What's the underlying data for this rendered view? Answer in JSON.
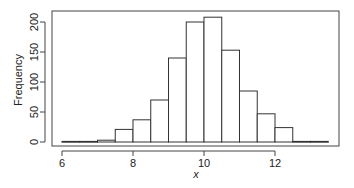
{
  "chart_data": {
    "type": "bar",
    "subtype": "histogram",
    "title": "",
    "xlabel": "x",
    "ylabel": "Frequency",
    "bin_width": 0.5,
    "bin_edges": [
      6.0,
      6.5,
      7.0,
      7.5,
      8.0,
      8.5,
      9.0,
      9.5,
      10.0,
      10.5,
      11.0,
      11.5,
      12.0,
      12.5,
      13.0,
      13.5
    ],
    "categories": [
      "6.0-6.5",
      "6.5-7.0",
      "7.0-7.5",
      "7.5-8.0",
      "8.0-8.5",
      "8.5-9.0",
      "9.0-9.5",
      "9.5-10.0",
      "10.0-10.5",
      "10.5-11.0",
      "11.0-11.5",
      "11.5-12.0",
      "12.0-12.5",
      "12.5-13.0",
      "13.0-13.5"
    ],
    "values": [
      1,
      1,
      3,
      21,
      37,
      70,
      140,
      200,
      208,
      153,
      85,
      47,
      24,
      1,
      1
    ],
    "xlim": [
      5.7,
      13.9
    ],
    "ylim": [
      0,
      215
    ],
    "xticks": [
      6,
      8,
      10,
      12
    ],
    "yticks": [
      0,
      50,
      100,
      150,
      200
    ],
    "grid": false,
    "legend": null,
    "bar_fill": "#ffffff",
    "bar_stroke": "#333333"
  }
}
